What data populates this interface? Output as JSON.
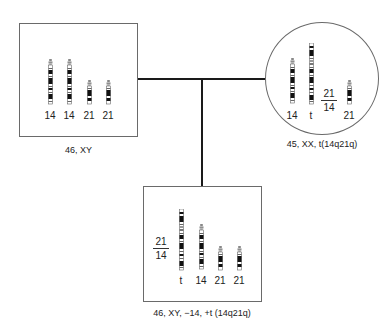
{
  "pedigree": {
    "father": {
      "shape": "square",
      "karyotype_label": "46, XY",
      "chromosomes": [
        {
          "label": "14",
          "type": "chr14"
        },
        {
          "label": "14",
          "type": "chr14"
        },
        {
          "label": "21",
          "type": "chr21"
        },
        {
          "label": "21",
          "type": "chr21"
        }
      ]
    },
    "mother": {
      "shape": "circle",
      "karyotype_label": "45, XX, t(14q21q)",
      "chromosomes": [
        {
          "label": "14",
          "type": "chr14"
        },
        {
          "label": "t",
          "type": "translocation"
        },
        {
          "label": "21",
          "type": "chr21"
        }
      ],
      "fraction": {
        "numerator": "21",
        "denominator": "14"
      }
    },
    "child": {
      "shape": "square",
      "karyotype_label": "46, XY, −14, +t (14q21q)",
      "chromosomes": [
        {
          "label": "t",
          "type": "translocation"
        },
        {
          "label": "14",
          "type": "chr14"
        },
        {
          "label": "21",
          "type": "chr21"
        },
        {
          "label": "21",
          "type": "chr21"
        }
      ],
      "fraction": {
        "numerator": "21",
        "denominator": "14"
      }
    }
  },
  "colors": {
    "line": "#1a1a1a",
    "border": "#6a6a6a",
    "band_dark": "#111111",
    "band_light": "#ffffff"
  }
}
